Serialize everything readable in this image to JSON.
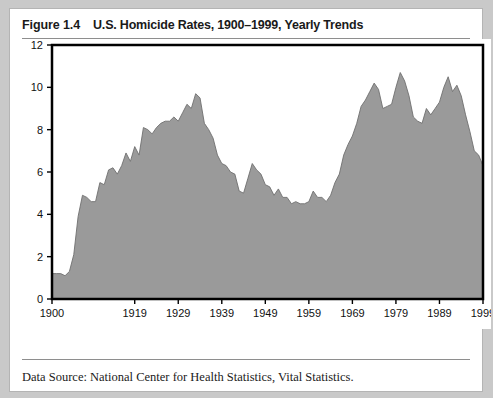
{
  "figure": {
    "number": "Figure 1.4",
    "caption": "U.S. Homicide Rates, 1900–1999, Yearly Trends",
    "source": "Data Source: National Center for Health Statistics, Vital Statistics."
  },
  "colors": {
    "area_fill": "#9a9a9a",
    "area_stroke": "#6f6f6f",
    "axis": "#000000",
    "page_border": "#c9c9c9",
    "card_background": "#ffffff",
    "rule": "#8e8e8e",
    "text": "#1a1a1a"
  },
  "chart_data": {
    "type": "area",
    "title": "U.S. Homicide Rates, 1900–1999, Yearly Trends",
    "xlabel": "",
    "ylabel": "",
    "xlim": [
      1900,
      1999
    ],
    "ylim": [
      0,
      12
    ],
    "grid": false,
    "legend": "none",
    "xticks": [
      1900,
      1919,
      1929,
      1939,
      1949,
      1959,
      1969,
      1979,
      1989,
      1999
    ],
    "xtick_labels": [
      "1900",
      "1919",
      "1929",
      "1939",
      "1949",
      "1959",
      "1969",
      "1979",
      "1989",
      "1999"
    ],
    "yticks": [
      0,
      2,
      4,
      6,
      8,
      10,
      12
    ],
    "ytick_labels": [
      "0",
      "2",
      "4",
      "6",
      "8",
      "10",
      "12"
    ],
    "series_name": "Homicide rate per 100,000",
    "x": [
      1900,
      1901,
      1902,
      1903,
      1904,
      1905,
      1906,
      1907,
      1908,
      1909,
      1910,
      1911,
      1912,
      1913,
      1914,
      1915,
      1916,
      1917,
      1918,
      1919,
      1920,
      1921,
      1922,
      1923,
      1924,
      1925,
      1926,
      1927,
      1928,
      1929,
      1930,
      1931,
      1932,
      1933,
      1934,
      1935,
      1936,
      1937,
      1938,
      1939,
      1940,
      1941,
      1942,
      1943,
      1944,
      1945,
      1946,
      1947,
      1948,
      1949,
      1950,
      1951,
      1952,
      1953,
      1954,
      1955,
      1956,
      1957,
      1958,
      1959,
      1960,
      1961,
      1962,
      1963,
      1964,
      1965,
      1966,
      1967,
      1968,
      1969,
      1970,
      1971,
      1972,
      1973,
      1974,
      1975,
      1976,
      1977,
      1978,
      1979,
      1980,
      1981,
      1982,
      1983,
      1984,
      1985,
      1986,
      1987,
      1988,
      1989,
      1990,
      1991,
      1992,
      1993,
      1994,
      1995,
      1996,
      1997,
      1998,
      1999
    ],
    "values": [
      1.2,
      1.2,
      1.2,
      1.1,
      1.3,
      2.1,
      3.9,
      4.9,
      4.8,
      4.6,
      4.6,
      5.5,
      5.4,
      6.1,
      6.2,
      5.9,
      6.3,
      6.9,
      6.5,
      7.2,
      6.8,
      8.1,
      8.0,
      7.8,
      8.1,
      8.3,
      8.4,
      8.4,
      8.6,
      8.4,
      8.8,
      9.2,
      9.0,
      9.7,
      9.5,
      8.3,
      8.0,
      7.6,
      6.8,
      6.4,
      6.3,
      6.0,
      5.9,
      5.1,
      5.0,
      5.7,
      6.4,
      6.1,
      5.9,
      5.4,
      5.3,
      4.9,
      5.2,
      4.8,
      4.8,
      4.5,
      4.6,
      4.5,
      4.5,
      4.6,
      5.1,
      4.8,
      4.8,
      4.6,
      4.9,
      5.5,
      5.9,
      6.8,
      7.3,
      7.7,
      8.3,
      9.1,
      9.4,
      9.8,
      10.2,
      9.9,
      9.0,
      9.1,
      9.2,
      10.0,
      10.7,
      10.3,
      9.6,
      8.6,
      8.4,
      8.3,
      9.0,
      8.7,
      9.0,
      9.3,
      10.0,
      10.5,
      9.8,
      10.1,
      9.6,
      8.7,
      7.9,
      7.0,
      6.8,
      6.3
    ],
    "annotations": [
      {
        "label": "1900 start",
        "x": 1900,
        "y": 1.2
      },
      {
        "label": "1933 prohibition-era peak",
        "x": 1933,
        "y": 9.7
      },
      {
        "label": "1946 postwar spike",
        "x": 1946,
        "y": 6.4
      },
      {
        "label": "1958 trough",
        "x": 1958,
        "y": 4.5
      },
      {
        "label": "1980 all-time peak",
        "x": 1980,
        "y": 10.7
      },
      {
        "label": "1991 secondary peak",
        "x": 1991,
        "y": 10.5
      },
      {
        "label": "1999 end",
        "x": 1999,
        "y": 6.3
      }
    ]
  }
}
